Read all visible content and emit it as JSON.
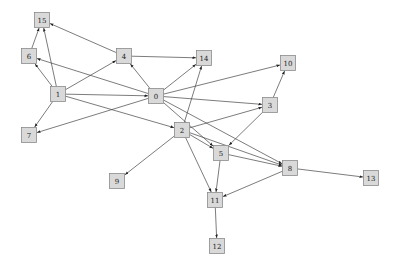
{
  "graph": {
    "type": "directed",
    "node_size": 15,
    "colors": {
      "node_fill": "#d9d9d9",
      "node_stroke": "#8a8a8a",
      "edge": "#444444",
      "background": "#ffffff"
    },
    "nodes": [
      {
        "id": "0",
        "label": "0",
        "x": 156,
        "y": 96
      },
      {
        "id": "1",
        "label": "1",
        "x": 58,
        "y": 94
      },
      {
        "id": "2",
        "label": "2",
        "x": 182,
        "y": 130
      },
      {
        "id": "3",
        "label": "3",
        "x": 270,
        "y": 105
      },
      {
        "id": "4",
        "label": "4",
        "x": 124,
        "y": 56
      },
      {
        "id": "5",
        "label": "5",
        "x": 221,
        "y": 153
      },
      {
        "id": "6",
        "label": "6",
        "x": 29,
        "y": 56
      },
      {
        "id": "7",
        "label": "7",
        "x": 29,
        "y": 135
      },
      {
        "id": "8",
        "label": "8",
        "x": 290,
        "y": 168
      },
      {
        "id": "9",
        "label": "9",
        "x": 117,
        "y": 181
      },
      {
        "id": "10",
        "label": "10",
        "x": 288,
        "y": 63
      },
      {
        "id": "11",
        "label": "11",
        "x": 215,
        "y": 200
      },
      {
        "id": "12",
        "label": "12",
        "x": 217,
        "y": 246
      },
      {
        "id": "13",
        "label": "13",
        "x": 371,
        "y": 178
      },
      {
        "id": "14",
        "label": "14",
        "x": 204,
        "y": 58
      },
      {
        "id": "15",
        "label": "15",
        "x": 42,
        "y": 20
      }
    ],
    "edges": [
      {
        "from": "1",
        "to": "15"
      },
      {
        "from": "1",
        "to": "6"
      },
      {
        "from": "1",
        "to": "4"
      },
      {
        "from": "1",
        "to": "0"
      },
      {
        "from": "1",
        "to": "2"
      },
      {
        "from": "1",
        "to": "7"
      },
      {
        "from": "6",
        "to": "15"
      },
      {
        "from": "4",
        "to": "15"
      },
      {
        "from": "4",
        "to": "14"
      },
      {
        "from": "0",
        "to": "4"
      },
      {
        "from": "0",
        "to": "6"
      },
      {
        "from": "0",
        "to": "7"
      },
      {
        "from": "0",
        "to": "14"
      },
      {
        "from": "0",
        "to": "10"
      },
      {
        "from": "0",
        "to": "3"
      },
      {
        "from": "0",
        "to": "5"
      },
      {
        "from": "0",
        "to": "8"
      },
      {
        "from": "2",
        "to": "14"
      },
      {
        "from": "2",
        "to": "3"
      },
      {
        "from": "2",
        "to": "5"
      },
      {
        "from": "2",
        "to": "8"
      },
      {
        "from": "2",
        "to": "9"
      },
      {
        "from": "2",
        "to": "11"
      },
      {
        "from": "3",
        "to": "10"
      },
      {
        "from": "3",
        "to": "5"
      },
      {
        "from": "5",
        "to": "8"
      },
      {
        "from": "5",
        "to": "11"
      },
      {
        "from": "8",
        "to": "11"
      },
      {
        "from": "8",
        "to": "13"
      },
      {
        "from": "11",
        "to": "12"
      }
    ]
  }
}
